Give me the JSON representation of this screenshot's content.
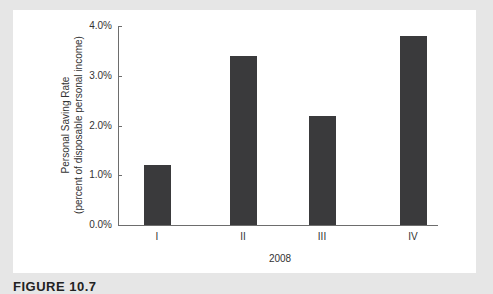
{
  "figure": {
    "caption": "FIGURE 10.7"
  },
  "chart_data": {
    "type": "bar",
    "title": "",
    "categories": [
      "I",
      "II",
      "III",
      "IV"
    ],
    "values": [
      1.2,
      3.4,
      2.2,
      3.8
    ],
    "xlabel": "2008",
    "ylabel": "Personal Saving Rate (percent of disposable personal income)",
    "ylabel_lines": [
      "Personal Saving Rate",
      "(percent of disposable personal income)"
    ],
    "y_ticks": [
      "0.0%",
      "1.0%",
      "2.0%",
      "3.0%",
      "4.0%"
    ],
    "ylim": [
      0,
      4.0
    ],
    "grid": false,
    "legend": null,
    "bar_color": "#3a3a3c"
  }
}
